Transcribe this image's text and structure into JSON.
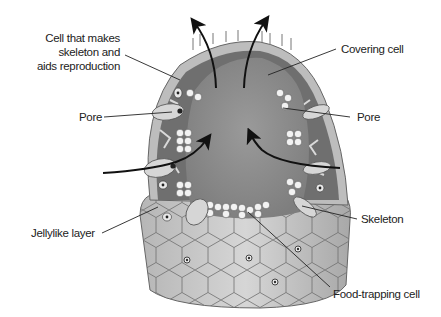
{
  "diagram": {
    "labels": {
      "cell_skeleton": [
        "Cell that makes",
        "skeleton and",
        "aids reproduction"
      ],
      "pore_left": "Pore",
      "jellylike_layer": "Jellylike layer",
      "covering_cell": "Covering cell",
      "pore_right": "Pore",
      "skeleton": "Skeleton",
      "food_trapping_cell": "Food-trapping cell"
    },
    "arrows": {
      "in_left": "water enters through left pore",
      "in_right": "water enters through right pore",
      "out_left": "water exits through top opening (left)",
      "out_right": "water exits through top opening (right)"
    },
    "colors": {
      "background": "#ffffff",
      "body_gray": "#a9a9a9",
      "central_cavity": "#8e8e8e",
      "wall_dark": "#6a6a6a",
      "outer_cells": "#c8c8c8",
      "cell_lines": "#555555",
      "arrow": "#111111",
      "leader_line": "#222222",
      "text": "#222222"
    }
  }
}
